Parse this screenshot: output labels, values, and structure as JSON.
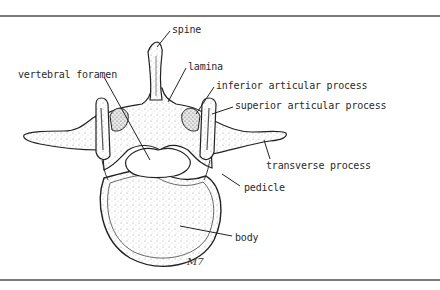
{
  "figure": {
    "signature": "M7",
    "labels": [
      {
        "id": "spine",
        "text": "spine",
        "x": 172,
        "y": 24
      },
      {
        "id": "vertebral-foramen",
        "text": "vertebral foramen",
        "x": 18,
        "y": 69
      },
      {
        "id": "lamina",
        "text": "lamina",
        "x": 188,
        "y": 61
      },
      {
        "id": "inferior-articular-process",
        "text": "inferior articular process",
        "x": 216,
        "y": 80
      },
      {
        "id": "superior-articular-process",
        "text": "superior articular process",
        "x": 235,
        "y": 100
      },
      {
        "id": "transverse-process",
        "text": "transverse process",
        "x": 266,
        "y": 160
      },
      {
        "id": "pedicle",
        "text": "pedicle",
        "x": 244,
        "y": 182
      },
      {
        "id": "body",
        "text": "body",
        "x": 235,
        "y": 232
      }
    ]
  },
  "colors": {
    "background": "#ffffff",
    "rule": "#7a7a7a",
    "ink": "#2a2a2a",
    "stipple": "#9a9a9a"
  }
}
